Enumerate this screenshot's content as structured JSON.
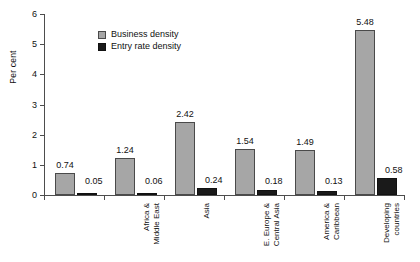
{
  "chart_data": {
    "type": "bar",
    "title": "",
    "subtitle": "",
    "xlabel": "",
    "ylabel": "Per cent",
    "ylim": [
      0,
      6
    ],
    "yticks": [
      0,
      1,
      2,
      3,
      4,
      5,
      6
    ],
    "ytick_labels": [
      "0",
      "1",
      "2",
      "3",
      "4",
      "5",
      "6"
    ],
    "grid": false,
    "legend_position": "upper-left-inside",
    "categories": [
      "Africa &\nMiddle East",
      "Asia",
      "E. Europe &\nCentral Asia",
      "America &\nCaribbean",
      "Developing\ncountries",
      "Industrialized\ncountries"
    ],
    "series": [
      {
        "name": "Business density",
        "color": "#a6a6a6",
        "values": [
          0.74,
          1.24,
          2.42,
          1.54,
          1.49,
          5.48
        ],
        "labels": [
          "0.74",
          "1.24",
          "2.42",
          "1.54",
          "1.49",
          "5.48"
        ]
      },
      {
        "name": "Entry rate density",
        "color": "#1a1a1a",
        "values": [
          0.05,
          0.06,
          0.24,
          0.18,
          0.13,
          0.58
        ],
        "labels": [
          "0.05",
          "0.06",
          "0.24",
          "0.18",
          "0.13",
          "0.58"
        ]
      }
    ]
  }
}
